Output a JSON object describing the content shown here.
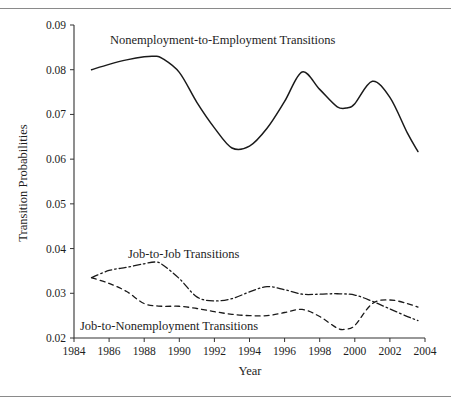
{
  "figure": {
    "background_color": "#ffffff",
    "rule_color": "#8a8a8a",
    "line_color": "#1a1a1a"
  },
  "chart_data": {
    "type": "line",
    "title": "",
    "xlabel": "Year",
    "ylabel": "Transition Probabilities",
    "xlim": [
      1984,
      2004
    ],
    "ylim": [
      0.02,
      0.09
    ],
    "xticks": [
      1984,
      1986,
      1988,
      1990,
      1992,
      1994,
      1996,
      1998,
      2000,
      2002,
      2004
    ],
    "xtick_labels": [
      "1984",
      "1986",
      "1988",
      "1990",
      "1992",
      "1994",
      "1996",
      "1998",
      "2000",
      "2002",
      "2004"
    ],
    "yticks": [
      0.02,
      0.03,
      0.04,
      0.05,
      0.06,
      0.07,
      0.08,
      0.09
    ],
    "ytick_labels": [
      "0.02",
      "0.03",
      "0.04",
      "0.05",
      "0.06",
      "0.07",
      "0.08",
      "0.09"
    ],
    "grid": false,
    "legend_position": "inline-annotations",
    "series": [
      {
        "name": "Nonemployment-to-Employment Transitions",
        "style": "solid",
        "x": [
          1985,
          1986,
          1987,
          1988,
          1988.6,
          1989,
          1990,
          1991,
          1992,
          1993,
          1994,
          1995,
          1996,
          1997,
          1998,
          1999,
          1999.6,
          2000,
          2001,
          2002,
          2003,
          2003.6
        ],
        "values": [
          0.08,
          0.0812,
          0.0822,
          0.0829,
          0.083,
          0.0826,
          0.0794,
          0.0727,
          0.067,
          0.0625,
          0.0629,
          0.0669,
          0.0729,
          0.0795,
          0.0756,
          0.0717,
          0.0715,
          0.0724,
          0.0774,
          0.0738,
          0.0658,
          0.0617
        ]
      },
      {
        "name": "Job-to-Job Transitions",
        "style": "dashdot",
        "x": [
          1985,
          1986,
          1987,
          1988,
          1988.6,
          1989,
          1990,
          1991,
          1992,
          1993,
          1994,
          1995,
          1996,
          1997,
          1998,
          1999,
          2000,
          2001,
          2002,
          2003,
          2003.6
        ],
        "values": [
          0.0335,
          0.0351,
          0.0358,
          0.0366,
          0.037,
          0.0365,
          0.0333,
          0.0292,
          0.0283,
          0.0288,
          0.0303,
          0.0315,
          0.0308,
          0.0298,
          0.0298,
          0.0299,
          0.0296,
          0.0282,
          0.0265,
          0.0248,
          0.0239
        ]
      },
      {
        "name": "Job-to-Nonemployment Transitions",
        "style": "dashed",
        "x": [
          1985,
          1986,
          1987,
          1988,
          1989,
          1990,
          1991,
          1992,
          1993,
          1994,
          1995,
          1996,
          1997,
          1998,
          1999,
          1999.5,
          2000,
          2001,
          2002,
          2003,
          2003.6
        ],
        "values": [
          0.0335,
          0.0322,
          0.0304,
          0.0277,
          0.0271,
          0.0271,
          0.0266,
          0.0259,
          0.0253,
          0.025,
          0.025,
          0.0257,
          0.0264,
          0.0248,
          0.0222,
          0.022,
          0.0228,
          0.0277,
          0.0285,
          0.0277,
          0.0269
        ]
      }
    ],
    "annotations": [
      {
        "id": "ann-nonemp-to-emp",
        "text": "Nonemployment-to-Employment Transitions",
        "x_px": 110,
        "y_px": 44
      },
      {
        "id": "ann-job-to-job",
        "text": "Job-to-Job Transitions",
        "x_px": 128,
        "y_px": 258
      },
      {
        "id": "ann-job-to-nonemp",
        "text": "Job-to-Nonemployment Transitions",
        "x_px": 80,
        "y_px": 330
      }
    ]
  }
}
